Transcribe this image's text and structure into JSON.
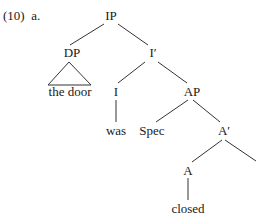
{
  "example": {
    "number": "(10)",
    "letter": "a."
  },
  "tree": {
    "nodes": [
      {
        "id": "ip",
        "label": "IP",
        "x": 111,
        "y": 9
      },
      {
        "id": "dp",
        "label": "DP",
        "x": 72,
        "y": 46
      },
      {
        "id": "ibar",
        "label": "I′",
        "x": 153,
        "y": 46
      },
      {
        "id": "the-door",
        "label": "the door",
        "x": 70,
        "y": 85
      },
      {
        "id": "i",
        "label": "I",
        "x": 116,
        "y": 85
      },
      {
        "id": "ap",
        "label": "AP",
        "x": 192,
        "y": 85
      },
      {
        "id": "was",
        "label": "was",
        "x": 116,
        "y": 124
      },
      {
        "id": "spec",
        "label": "Spec",
        "x": 152,
        "y": 124
      },
      {
        "id": "abar",
        "label": "A′",
        "x": 224,
        "y": 124
      },
      {
        "id": "a",
        "label": "A",
        "x": 188,
        "y": 164
      },
      {
        "id": "closed",
        "label": "closed",
        "x": 188,
        "y": 202
      }
    ],
    "edges": [
      [
        "ip",
        "dp"
      ],
      [
        "ip",
        "ibar"
      ],
      [
        "ibar",
        "i"
      ],
      [
        "ibar",
        "ap"
      ],
      [
        "i",
        "was"
      ],
      [
        "ap",
        "spec"
      ],
      [
        "ap",
        "abar"
      ],
      [
        "abar",
        "a"
      ],
      [
        "abar",
        "(offscreen complement)"
      ],
      [
        "a",
        "closed"
      ]
    ],
    "triangle_under": "dp"
  }
}
